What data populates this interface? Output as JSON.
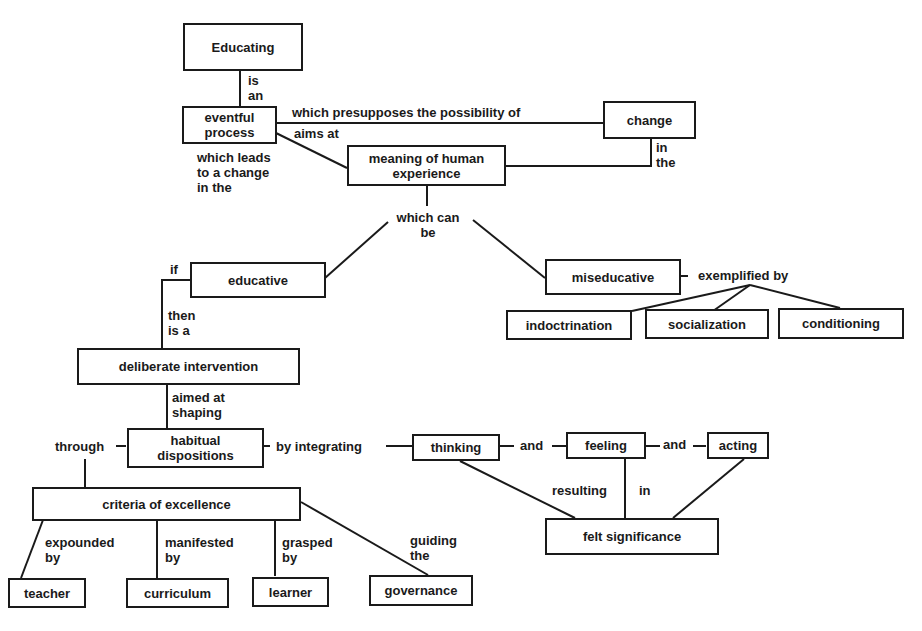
{
  "diagram": {
    "colors": {
      "ink": "#1a1a1a",
      "background": "#ffffff"
    },
    "nodes": {
      "educating": "Educating",
      "eventful_process": "eventful\nprocess",
      "change": "change",
      "meaning": "meaning of human\nexperience",
      "educative": "educative",
      "miseducative": "miseducative",
      "indoctrination": "indoctrination",
      "socialization": "socialization",
      "conditioning": "conditioning",
      "deliberate_intervention": "deliberate intervention",
      "habitual_dispositions": "habitual\ndispositions",
      "thinking": "thinking",
      "feeling": "feeling",
      "acting": "acting",
      "felt_significance": "felt significance",
      "criteria": "criteria of excellence",
      "teacher": "teacher",
      "curriculum": "curriculum",
      "learner": "learner",
      "governance": "governance"
    },
    "links": {
      "is_an": "is\nan",
      "presupposes": "which presupposes the possibility of",
      "aims_at": "aims at",
      "leads_to": "which leads\nto a change\nin the",
      "in_the": "in\nthe",
      "which_can_be": "which can\nbe",
      "if": "if",
      "exemplified_by": "exemplified by",
      "then_is_a": "then\nis a",
      "aimed_at_shaping": "aimed at\nshaping",
      "through": "through",
      "by_integrating": "by integrating",
      "and_1": "and",
      "and_2": "and",
      "resulting": "resulting",
      "in": "in",
      "expounded_by": "expounded\nby",
      "manifested_by": "manifested\nby",
      "grasped_by": "grasped\nby",
      "guiding_the": "guiding\nthe"
    }
  }
}
